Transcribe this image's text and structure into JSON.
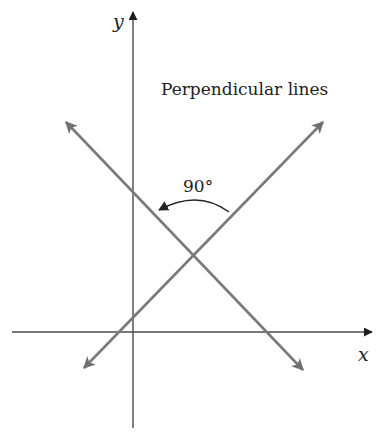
{
  "diagram": {
    "title": "Perpendicular lines",
    "angle_label": "90°",
    "axes": {
      "x_label": "x",
      "y_label": "y"
    },
    "colors": {
      "axis": "#3a3a3a",
      "lines": "#7a7a7a",
      "text": "#222222",
      "background": "#ffffff"
    },
    "lines": [
      {
        "name": "decreasing-line",
        "from": [
          66,
          122
        ],
        "to": [
          303,
          370
        ]
      },
      {
        "name": "increasing-line",
        "from": [
          84,
          368
        ],
        "to": [
          323,
          122
        ]
      }
    ],
    "intersection": [
      193,
      253
    ],
    "angle_degrees": 90
  }
}
